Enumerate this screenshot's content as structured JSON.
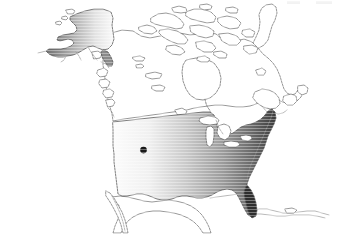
{
  "figure": {
    "type": "choropleth-map",
    "title": "",
    "subtitle": "",
    "width": 341,
    "height": 234,
    "background_color": "#ffffff",
    "projection_note": "North America, conic"
  },
  "chart_data": {
    "type": "heatmap",
    "title": "",
    "xlabel": "",
    "ylabel": "",
    "legend_position": "none",
    "grid": false,
    "colorscale": {
      "name": "grayscale",
      "light": "#ffffff",
      "mid": "#9a9a9a",
      "dark": "#3a3a3a",
      "darkest": "#2b2b2b"
    },
    "regions": [
      {
        "name": "United States (contiguous)",
        "code": "US-48",
        "fill_style": "linear-gradient-west-to-east",
        "value_west": 0.05,
        "value_east": 0.92,
        "stops": [
          {
            "offset": 0.0,
            "color": "#fcfcfc"
          },
          {
            "offset": 0.22,
            "color": "#f0f0f0"
          },
          {
            "offset": 0.45,
            "color": "#c9c9c9"
          },
          {
            "offset": 0.68,
            "color": "#9a9a9a"
          },
          {
            "offset": 0.85,
            "color": "#6a6a6a"
          },
          {
            "offset": 1.0,
            "color": "#3a3a3a"
          }
        ]
      },
      {
        "name": "Alaska",
        "code": "US-AK",
        "fill_style": "linear-gradient-west-to-east",
        "value_west": 0.72,
        "value_east": 0.06,
        "stops": [
          {
            "offset": 0.0,
            "color": "#6f6f6f"
          },
          {
            "offset": 0.35,
            "color": "#a8a8a8"
          },
          {
            "offset": 0.72,
            "color": "#e2e2e2"
          },
          {
            "offset": 1.0,
            "color": "#fafafa"
          }
        ]
      },
      {
        "name": "Canada",
        "code": "CA",
        "fill_style": "outline-only",
        "value": null
      },
      {
        "name": "Mexico",
        "code": "MX",
        "fill_style": "outline-only",
        "value": null
      },
      {
        "name": "Greenland",
        "code": "GL",
        "fill_style": "outline-only",
        "value": null
      },
      {
        "name": "Caribbean islands",
        "code": "CARIB",
        "fill_style": "outline-only",
        "value": null
      }
    ],
    "markers": [
      {
        "label": "",
        "shape": "circle",
        "color": "#1a1a1a",
        "radius_px": 3.2,
        "x_px": 143.5,
        "y_px": 150.0
      }
    ],
    "annotations": []
  },
  "features": {
    "great_lakes_label": "Great Lakes",
    "hudson_bay_label": "Hudson Bay",
    "arctic_archipelago_label": "Canadian Arctic Archipelago"
  }
}
